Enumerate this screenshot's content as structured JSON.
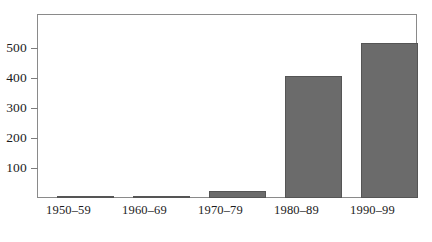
{
  "chart_data": {
    "type": "bar",
    "title": "",
    "subtitle": "",
    "xlabel": "",
    "ylabel": "",
    "categories": [
      "1950–59",
      "1960–69",
      "1970–79",
      "1980–89",
      "1990–99"
    ],
    "values": [
      1,
      3,
      23,
      408,
      518
    ],
    "series": [
      {
        "name": "",
        "values": [
          1,
          3,
          23,
          408,
          518
        ]
      }
    ],
    "ylim": [
      0,
      613
    ],
    "xlim": [
      0,
      5
    ],
    "yticks": [
      100,
      200,
      300,
      400,
      500
    ],
    "ytick_labels": [
      "100",
      "200",
      "300",
      "400",
      "500"
    ],
    "grid": false,
    "legend": false,
    "legend_position": "none",
    "annotations": [],
    "bar_color": "#6b6b6b",
    "bar_edge_color": "#555555",
    "frame_color": "#8a8a8a",
    "background_color": "#ffffff",
    "text_color": "#1c1c1c"
  }
}
